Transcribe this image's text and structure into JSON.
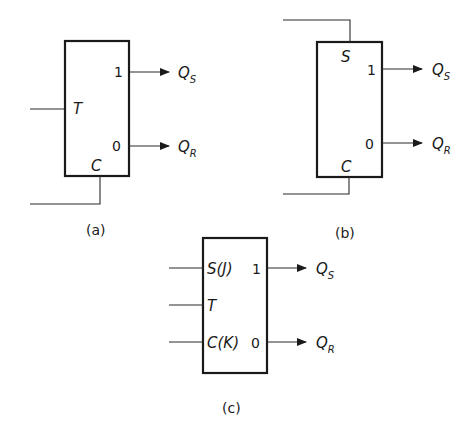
{
  "colors": {
    "ink": "#1a1a1a",
    "background": "#ffffff"
  },
  "diagrams": {
    "a": {
      "caption": "(a)",
      "inputs": {
        "t": "T",
        "c": "C"
      },
      "outputs": {
        "one": "1",
        "zero": "0"
      },
      "out_labels": {
        "qs_main": "Q",
        "qs_sub": "S",
        "qr_main": "Q",
        "qr_sub": "R"
      }
    },
    "b": {
      "caption": "(b)",
      "inputs": {
        "s": "S",
        "c": "C"
      },
      "outputs": {
        "one": "1",
        "zero": "0"
      },
      "out_labels": {
        "qs_main": "Q",
        "qs_sub": "S",
        "qr_main": "Q",
        "qr_sub": "R"
      }
    },
    "c": {
      "caption": "(c)",
      "inputs": {
        "sj": "S(J)",
        "t": "T",
        "ck": "C(K)"
      },
      "outputs": {
        "one": "1",
        "zero": "0"
      },
      "out_labels": {
        "qs_main": "Q",
        "qs_sub": "S",
        "qr_main": "Q",
        "qr_sub": "R"
      }
    }
  }
}
